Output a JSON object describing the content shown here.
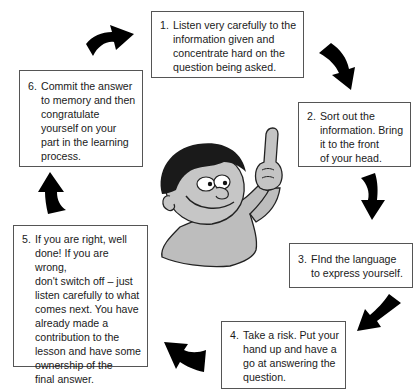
{
  "diagram": {
    "type": "cycle",
    "steps": [
      {
        "number": "1.",
        "text": "Listen very carefully to the\ninformation given and\nconcentrate hard on the\nquestion being asked."
      },
      {
        "number": "2.",
        "text": "Sort out the\ninformation. Bring\nit to the front\nof your head."
      },
      {
        "number": "3.",
        "text": "FInd the language\nto express yourself."
      },
      {
        "number": "4.",
        "text": "Take a risk. Put your\nhand up and have a\ngo at answering the\nquestion."
      },
      {
        "number": "5.",
        "text": "If you are right, well\ndone! If you are wrong,\ndon't switch off – just\nlisten carefully to what\ncomes next. You have\nalready made a\ncontribution to the\nlesson and have some\nownership of the\nfinal answer."
      },
      {
        "number": "6.",
        "text": "Commit the answer\nto memory and then\ncongratulate\nyourself on your\npart in the learning\nprocess."
      }
    ],
    "arrows": [
      {
        "from": "6",
        "to": "1",
        "icon": "curved-arrow-right-icon"
      },
      {
        "from": "1",
        "to": "2",
        "icon": "curved-arrow-down-right-icon"
      },
      {
        "from": "2",
        "to": "3",
        "icon": "curved-arrow-down-icon"
      },
      {
        "from": "3",
        "to": "4",
        "icon": "curved-arrow-down-left-icon"
      },
      {
        "from": "4",
        "to": "5",
        "icon": "curved-arrow-up-left-icon"
      },
      {
        "from": "5",
        "to": "6",
        "icon": "curved-arrow-up-icon"
      }
    ],
    "center_figure": "cartoon-child-pointing-up",
    "colors": {
      "arrow": "#000000",
      "border": "#555555",
      "figure_fill": "#b8b8b8",
      "hair": "#1a1a1a"
    }
  }
}
